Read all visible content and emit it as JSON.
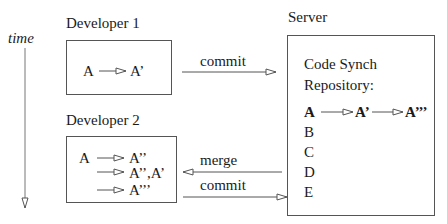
{
  "time_axis": {
    "label": "time"
  },
  "developer1": {
    "title": "Developer 1",
    "lines": [
      {
        "from": "A",
        "to": "A’"
      }
    ]
  },
  "developer2": {
    "title": "Developer 2",
    "lines": [
      {
        "from": "A",
        "to": "A’’"
      },
      {
        "from": "",
        "to": "A’’,A’"
      },
      {
        "from": "",
        "to": "A’’’"
      }
    ]
  },
  "server": {
    "title": "Server",
    "heading_line1": "Code Synch",
    "heading_line2": "Repository:",
    "chain": [
      "A",
      "A’",
      "A’’’"
    ],
    "items": [
      "B",
      "C",
      "D",
      "E"
    ]
  },
  "arrows": {
    "dev1_commit": "commit",
    "dev2_merge": "merge",
    "dev2_commit": "commit"
  },
  "colors": {
    "line": "#555555",
    "text": "#1a1a1a"
  }
}
